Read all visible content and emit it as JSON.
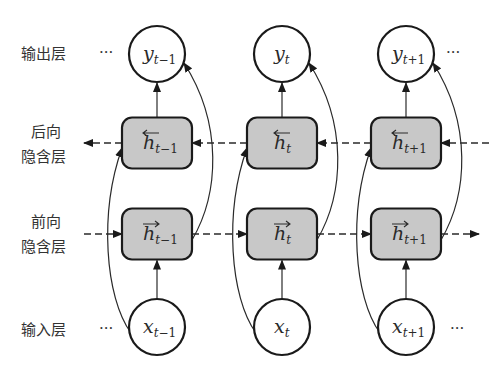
{
  "layers": {
    "output": {
      "label": "输出层"
    },
    "backward": {
      "label_line1": "后向",
      "label_line2": "隐含层"
    },
    "forward": {
      "label_line1": "前向",
      "label_line2": "隐含层"
    },
    "input": {
      "label": "输入层"
    }
  },
  "ellipsis": "···",
  "timesteps": [
    {
      "output": {
        "var": "y",
        "sub": "t",
        "sub_suffix": "−1"
      },
      "backward": {
        "var": "h",
        "sub": "t",
        "sub_suffix": "−1",
        "direction": "left"
      },
      "forward": {
        "var": "h",
        "sub": "t",
        "sub_suffix": "−1",
        "direction": "right"
      },
      "input": {
        "var": "x",
        "sub": "t",
        "sub_suffix": "−1"
      }
    },
    {
      "output": {
        "var": "y",
        "sub": "t",
        "sub_suffix": ""
      },
      "backward": {
        "var": "h",
        "sub": "t",
        "sub_suffix": "",
        "direction": "left"
      },
      "forward": {
        "var": "h",
        "sub": "t",
        "sub_suffix": "",
        "direction": "right"
      },
      "input": {
        "var": "x",
        "sub": "t",
        "sub_suffix": ""
      }
    },
    {
      "output": {
        "var": "y",
        "sub": "t",
        "sub_suffix": "+1"
      },
      "backward": {
        "var": "h",
        "sub": "t",
        "sub_suffix": "+1",
        "direction": "left"
      },
      "forward": {
        "var": "h",
        "sub": "t",
        "sub_suffix": "+1",
        "direction": "right"
      },
      "input": {
        "var": "x",
        "sub": "t",
        "sub_suffix": "+1"
      }
    }
  ],
  "colors": {
    "box_fill": "#c8c8c8",
    "stroke": "#1a1a1a"
  }
}
